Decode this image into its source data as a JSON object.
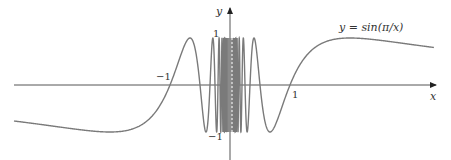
{
  "chart_data": {
    "type": "line",
    "title": "",
    "function_label": "y = sin(π/x)",
    "xlabel": "x",
    "ylabel": "y",
    "x_ticks": [
      {
        "value": -1,
        "label": "−1"
      },
      {
        "value": 1,
        "label": "1"
      }
    ],
    "y_ticks": [
      {
        "value": 1,
        "label": "1"
      },
      {
        "value": -1,
        "label": "−1"
      }
    ],
    "xlim": [
      -3.6,
      3.4
    ],
    "ylim": [
      -1.6,
      1.55
    ],
    "grid": false,
    "legend": "none",
    "series": [
      {
        "name": "y = sin(π/x)",
        "expression": "sin(pi/x)",
        "domain": [
          -3.6,
          3.4
        ],
        "sample_points": [
          {
            "x": -3.5,
            "y": -0.782
          },
          {
            "x": -2.0,
            "y": -1.0
          },
          {
            "x": -1.0,
            "y": 0.0
          },
          {
            "x": -0.667,
            "y": 1.0
          },
          {
            "x": -0.5,
            "y": 0.0
          },
          {
            "x": -0.4,
            "y": -1.0
          },
          {
            "x": 0.4,
            "y": 1.0
          },
          {
            "x": 0.5,
            "y": 0.0
          },
          {
            "x": 0.667,
            "y": -1.0
          },
          {
            "x": 1.0,
            "y": 0.0
          },
          {
            "x": 2.0,
            "y": 1.0
          },
          {
            "x": 3.4,
            "y": 0.801
          }
        ]
      }
    ],
    "annotations": [
      {
        "type": "dashed-vertical-line",
        "x": 0,
        "y_range": [
          -1,
          1
        ]
      }
    ],
    "colors": {
      "curve": "#7a7a7a",
      "axes": "#555555",
      "text": "#333333"
    }
  }
}
